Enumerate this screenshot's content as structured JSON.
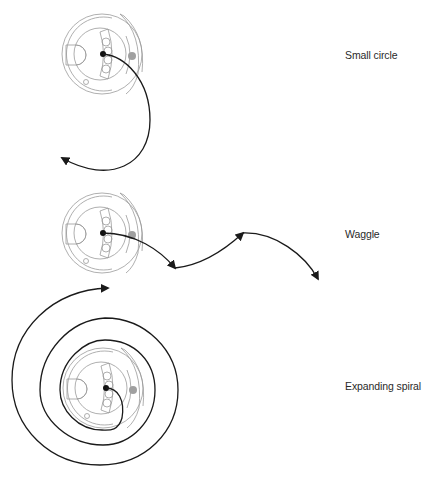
{
  "diagram": {
    "rows": [
      {
        "id": "small-circle",
        "label": "Small circle"
      },
      {
        "id": "waggle",
        "label": "Waggle"
      },
      {
        "id": "expanding-spiral",
        "label": "Expanding spiral"
      }
    ],
    "colors": {
      "path": "#1a1a1a",
      "device_outline": "#9a9a9a",
      "indicator_dot": "#a0a0a0",
      "label_text": "#2a2a2a"
    },
    "icons": [
      "robot-device-icon",
      "arrowhead-icon"
    ]
  }
}
